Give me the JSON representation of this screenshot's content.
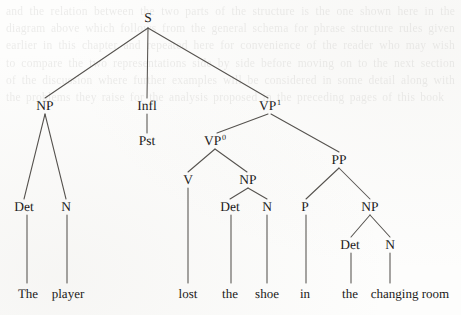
{
  "figure": {
    "name": "syntactic-tree-diagram",
    "sentence": "The player lost the shoe in the changing room",
    "ink_color": "#1b1a19",
    "line_color": "#55524e",
    "background_color": "#fdfdfc"
  },
  "nodes": [
    {
      "id": "s",
      "label": "S",
      "sup": "",
      "x": 148,
      "y": 18,
      "kind": "category"
    },
    {
      "id": "np1",
      "label": "NP",
      "sup": "",
      "x": 45,
      "y": 106,
      "kind": "category"
    },
    {
      "id": "infl",
      "label": "Infl",
      "sup": "",
      "x": 147,
      "y": 106,
      "kind": "category"
    },
    {
      "id": "vp1",
      "label": "VP",
      "sup": "1",
      "x": 270,
      "y": 106,
      "kind": "category"
    },
    {
      "id": "pst",
      "label": "Pst",
      "sup": "",
      "x": 147,
      "y": 141,
      "kind": "category"
    },
    {
      "id": "vp0",
      "label": "VP",
      "sup": "0",
      "x": 215,
      "y": 141,
      "kind": "category"
    },
    {
      "id": "pp",
      "label": "PP",
      "sup": "",
      "x": 339,
      "y": 160,
      "kind": "category"
    },
    {
      "id": "det1",
      "label": "Det",
      "sup": "",
      "x": 24,
      "y": 207,
      "kind": "category"
    },
    {
      "id": "n1",
      "label": "N",
      "sup": "",
      "x": 66,
      "y": 207,
      "kind": "category"
    },
    {
      "id": "v",
      "label": "V",
      "sup": "",
      "x": 188,
      "y": 180,
      "kind": "category"
    },
    {
      "id": "np2",
      "label": "NP",
      "sup": "",
      "x": 248,
      "y": 180,
      "kind": "category"
    },
    {
      "id": "det2",
      "label": "Det",
      "sup": "",
      "x": 230,
      "y": 207,
      "kind": "category"
    },
    {
      "id": "n2",
      "label": "N",
      "sup": "",
      "x": 267,
      "y": 207,
      "kind": "category"
    },
    {
      "id": "p",
      "label": "P",
      "sup": "",
      "x": 305,
      "y": 207,
      "kind": "category"
    },
    {
      "id": "np3",
      "label": "NP",
      "sup": "",
      "x": 370,
      "y": 207,
      "kind": "category"
    },
    {
      "id": "det3",
      "label": "Det",
      "sup": "",
      "x": 350,
      "y": 245,
      "kind": "category"
    },
    {
      "id": "n3",
      "label": "N",
      "sup": "",
      "x": 390,
      "y": 245,
      "kind": "category"
    },
    {
      "id": "w-the1",
      "label": "The",
      "sup": "",
      "x": 28,
      "y": 293,
      "kind": "word"
    },
    {
      "id": "w-player",
      "label": "player",
      "sup": "",
      "x": 68,
      "y": 293,
      "kind": "word"
    },
    {
      "id": "w-lost",
      "label": "lost",
      "sup": "",
      "x": 188,
      "y": 293,
      "kind": "word"
    },
    {
      "id": "w-the2",
      "label": "the",
      "sup": "",
      "x": 230,
      "y": 293,
      "kind": "word"
    },
    {
      "id": "w-shoe",
      "label": "shoe",
      "sup": "",
      "x": 267,
      "y": 293,
      "kind": "word"
    },
    {
      "id": "w-in",
      "label": "in",
      "sup": "",
      "x": 305,
      "y": 293,
      "kind": "word"
    },
    {
      "id": "w-the3",
      "label": "the",
      "sup": "",
      "x": 350,
      "y": 293,
      "kind": "word"
    },
    {
      "id": "w-room",
      "label": "changing room",
      "sup": "",
      "x": 410,
      "y": 293,
      "kind": "word"
    }
  ],
  "edges": [
    {
      "from": "s",
      "to": "np1",
      "x1": 148,
      "y1": 28,
      "x2": 45,
      "y2": 98
    },
    {
      "from": "s",
      "to": "infl",
      "x1": 148,
      "y1": 28,
      "x2": 147,
      "y2": 98
    },
    {
      "from": "s",
      "to": "vp1",
      "x1": 148,
      "y1": 28,
      "x2": 268,
      "y2": 98
    },
    {
      "from": "np1",
      "to": "det1",
      "x1": 45,
      "y1": 114,
      "x2": 24,
      "y2": 199
    },
    {
      "from": "np1",
      "to": "n1",
      "x1": 45,
      "y1": 114,
      "x2": 66,
      "y2": 199
    },
    {
      "from": "infl",
      "to": "pst",
      "x1": 147,
      "y1": 114,
      "x2": 147,
      "y2": 133
    },
    {
      "from": "vp1",
      "to": "vp0",
      "x1": 268,
      "y1": 114,
      "x2": 217,
      "y2": 133
    },
    {
      "from": "vp1",
      "to": "pp",
      "x1": 271,
      "y1": 114,
      "x2": 339,
      "y2": 152
    },
    {
      "from": "vp0",
      "to": "v",
      "x1": 215,
      "y1": 149,
      "x2": 188,
      "y2": 172
    },
    {
      "from": "vp0",
      "to": "np2",
      "x1": 215,
      "y1": 149,
      "x2": 247,
      "y2": 172
    },
    {
      "from": "np2",
      "to": "det2",
      "x1": 248,
      "y1": 188,
      "x2": 230,
      "y2": 199
    },
    {
      "from": "np2",
      "to": "n2",
      "x1": 248,
      "y1": 188,
      "x2": 267,
      "y2": 199
    },
    {
      "from": "pp",
      "to": "p",
      "x1": 339,
      "y1": 168,
      "x2": 306,
      "y2": 199
    },
    {
      "from": "pp",
      "to": "np3",
      "x1": 339,
      "y1": 168,
      "x2": 370,
      "y2": 199
    },
    {
      "from": "np3",
      "to": "det3",
      "x1": 370,
      "y1": 215,
      "x2": 351,
      "y2": 237
    },
    {
      "from": "np3",
      "to": "n3",
      "x1": 370,
      "y1": 215,
      "x2": 390,
      "y2": 237
    },
    {
      "from": "det1",
      "to": "w-the1",
      "x1": 27,
      "y1": 215,
      "x2": 27,
      "y2": 283
    },
    {
      "from": "n1",
      "to": "w-player",
      "x1": 67,
      "y1": 215,
      "x2": 67,
      "y2": 283
    },
    {
      "from": "v",
      "to": "w-lost",
      "x1": 188,
      "y1": 188,
      "x2": 188,
      "y2": 283
    },
    {
      "from": "det2",
      "to": "w-the2",
      "x1": 231,
      "y1": 215,
      "x2": 231,
      "y2": 283
    },
    {
      "from": "n2",
      "to": "w-shoe",
      "x1": 267,
      "y1": 215,
      "x2": 267,
      "y2": 283
    },
    {
      "from": "p",
      "to": "w-in",
      "x1": 306,
      "y1": 215,
      "x2": 306,
      "y2": 283
    },
    {
      "from": "det3",
      "to": "w-the3",
      "x1": 351,
      "y1": 253,
      "x2": 351,
      "y2": 283
    },
    {
      "from": "n3",
      "to": "w-room",
      "x1": 390,
      "y1": 253,
      "x2": 390,
      "y2": 283
    }
  ],
  "bleed_text": "and the relation between the two parts of the structure is the one shown here in the diagram above which follows from the general schema for phrase structure rules given earlier in this chapter and repeated here for convenience of the reader who may wish to compare the two representations side by side before moving on to the next section of the discussion where further examples will be considered in some detail along with the problems they raise for the analysis proposed in the preceding pages of this book"
}
